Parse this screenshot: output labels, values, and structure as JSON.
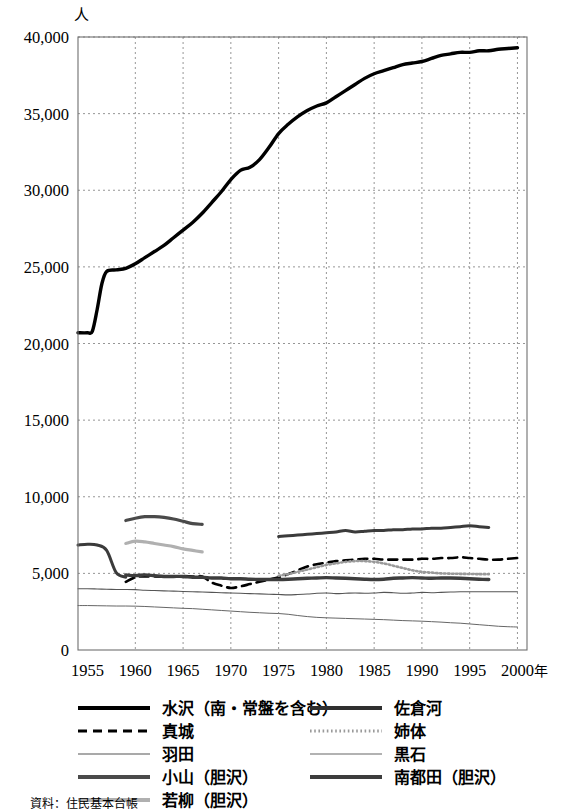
{
  "chart_data": {
    "type": "line",
    "title": "",
    "xlabel": "年",
    "ylabel": "人",
    "xlim": [
      1954,
      2001
    ],
    "ylim": [
      0,
      40000
    ],
    "grid": true,
    "legend_position": "bottom",
    "x_ticks": [
      "1955",
      "1960",
      "1965",
      "1970",
      "1975",
      "1980",
      "1985",
      "1990",
      "1995",
      "2000"
    ],
    "x_tick_values": [
      1955,
      1960,
      1965,
      1970,
      1975,
      1980,
      1985,
      1990,
      1995,
      2000
    ],
    "y_ticks": [
      "0",
      "5,000",
      "10,000",
      "15,000",
      "20,000",
      "25,000",
      "30,000",
      "35,000",
      "40,000"
    ],
    "y_tick_values": [
      0,
      5000,
      10000,
      15000,
      20000,
      25000,
      30000,
      35000,
      40000
    ],
    "series": [
      {
        "name": "水沢（南・常盤を含む）",
        "style": "thick-solid",
        "color": "#000000",
        "width": 3.4,
        "dash": "",
        "x": [
          1954,
          1955,
          1955.5,
          1956,
          1956.5,
          1957,
          1958,
          1959,
          1960,
          1961,
          1962,
          1963,
          1964,
          1965,
          1966,
          1967,
          1968,
          1969,
          1970,
          1971,
          1972,
          1973,
          1974,
          1975,
          1976,
          1977,
          1978,
          1979,
          1980,
          1981,
          1982,
          1983,
          1984,
          1985,
          1986,
          1987,
          1988,
          1989,
          1990,
          1991,
          1992,
          1993,
          1994,
          1995,
          1996,
          1997,
          1998,
          1999,
          2000
        ],
        "values": [
          20700,
          20700,
          20800,
          22200,
          23900,
          24700,
          24800,
          24900,
          25200,
          25600,
          26000,
          26400,
          26900,
          27400,
          27900,
          28500,
          29200,
          29900,
          30700,
          31300,
          31500,
          32000,
          32800,
          33700,
          34300,
          34800,
          35200,
          35500,
          35700,
          36100,
          36500,
          36900,
          37300,
          37600,
          37800,
          38000,
          38200,
          38300,
          38400,
          38600,
          38800,
          38900,
          39000,
          39000,
          39100,
          39100,
          39200,
          39250,
          39300
        ]
      },
      {
        "name": "佐倉河",
        "style": "thick-solid",
        "color": "#3b3b3b",
        "width": 3.0,
        "dash": "",
        "segments": [
          {
            "x": [
              1954,
              1955,
              1956,
              1957,
              1958,
              1959
            ],
            "values": [
              6850,
              6900,
              6850,
              6500,
              5050,
              4750
            ]
          },
          {
            "x": [
              1975,
              1976,
              1977,
              1978,
              1979,
              1980,
              1981,
              1982,
              1983,
              1984,
              1985,
              1986,
              1987,
              1988,
              1989,
              1990,
              1991,
              1992,
              1993,
              1994,
              1995,
              1996,
              1997
            ],
            "values": [
              7400,
              7450,
              7500,
              7550,
              7600,
              7650,
              7700,
              7800,
              7700,
              7750,
              7800,
              7800,
              7850,
              7850,
              7900,
              7900,
              7950,
              7950,
              8000,
              8050,
              8100,
              8050,
              8000
            ]
          }
        ]
      },
      {
        "name": "真城",
        "style": "thick-dashed",
        "color": "#000000",
        "width": 2.6,
        "dash": "9 6",
        "x": [
          1959,
          1960,
          1961,
          1962,
          1963,
          1964,
          1965,
          1966,
          1967,
          1968,
          1969,
          1970,
          1971,
          1972,
          1973,
          1974,
          1975,
          1976,
          1977,
          1978,
          1979,
          1980,
          1981,
          1982,
          1983,
          1984,
          1985,
          1986,
          1987,
          1988,
          1989,
          1990,
          1991,
          1992,
          1993,
          1994,
          1995,
          1996,
          1997,
          1998,
          1999,
          2000
        ],
        "values": [
          4450,
          4750,
          4800,
          4800,
          4780,
          4800,
          4820,
          4800,
          4790,
          4400,
          4200,
          4050,
          4150,
          4300,
          4450,
          4600,
          4750,
          4950,
          5200,
          5450,
          5600,
          5700,
          5800,
          5850,
          5900,
          5950,
          5950,
          5900,
          5900,
          5900,
          5900,
          5950,
          5950,
          6000,
          6000,
          6050,
          6000,
          5950,
          5900,
          5900,
          5950,
          6000
        ]
      },
      {
        "name": "姉体",
        "style": "dotted",
        "color": "#9a9a9a",
        "width": 2.6,
        "dash": "1.5 2.5",
        "x": [
          1975,
          1976,
          1977,
          1978,
          1979,
          1980,
          1981,
          1982,
          1983,
          1984,
          1985,
          1986,
          1987,
          1988,
          1989,
          1990,
          1991,
          1992,
          1993,
          1994,
          1995,
          1996,
          1997
        ],
        "values": [
          4850,
          4950,
          5100,
          5250,
          5400,
          5550,
          5650,
          5750,
          5800,
          5800,
          5750,
          5650,
          5500,
          5350,
          5200,
          5100,
          5050,
          5000,
          4980,
          4970,
          4960,
          4950,
          4950
        ]
      },
      {
        "name": "羽田",
        "style": "thin-solid",
        "color": "#555555",
        "width": 1.1,
        "dash": "",
        "x": [
          1954,
          1955,
          1956,
          1957,
          1958,
          1959,
          1960,
          1961,
          1962,
          1963,
          1964,
          1965,
          1966,
          1967,
          1968,
          1969,
          1970,
          1971,
          1972,
          1973,
          1974,
          1975,
          1976,
          1977,
          1978,
          1979,
          1980,
          1981,
          1982,
          1983,
          1984,
          1985,
          1986,
          1987,
          1988,
          1989,
          1990,
          1991,
          1992,
          1993,
          1994,
          1995,
          1996,
          1997,
          1998,
          1999,
          2000
        ],
        "values": [
          4000,
          4000,
          3980,
          3960,
          3950,
          3950,
          3940,
          3900,
          3880,
          3860,
          3840,
          3820,
          3800,
          3780,
          3760,
          3740,
          3720,
          3700,
          3680,
          3660,
          3640,
          3620,
          3600,
          3620,
          3650,
          3700,
          3720,
          3680,
          3700,
          3720,
          3700,
          3720,
          3760,
          3740,
          3700,
          3720,
          3760,
          3740,
          3760,
          3780,
          3800,
          3800,
          3800,
          3800,
          3800,
          3800,
          3800
        ]
      },
      {
        "name": "黒石",
        "style": "thin-solid",
        "color": "#666666",
        "width": 1.0,
        "dash": "",
        "x": [
          1954,
          1955,
          1956,
          1957,
          1958,
          1959,
          1960,
          1961,
          1962,
          1963,
          1964,
          1965,
          1966,
          1967,
          1968,
          1969,
          1970,
          1971,
          1972,
          1973,
          1974,
          1975,
          1976,
          1977,
          1978,
          1979,
          1980,
          1981,
          1982,
          1983,
          1984,
          1985,
          1986,
          1987,
          1988,
          1989,
          1990,
          1991,
          1992,
          1993,
          1994,
          1995,
          1996,
          1997,
          1998,
          1999,
          2000
        ],
        "values": [
          2900,
          2900,
          2890,
          2880,
          2870,
          2870,
          2860,
          2840,
          2810,
          2780,
          2750,
          2720,
          2700,
          2660,
          2620,
          2580,
          2540,
          2500,
          2460,
          2430,
          2400,
          2380,
          2330,
          2250,
          2180,
          2130,
          2100,
          2080,
          2060,
          2040,
          2020,
          2000,
          1980,
          1950,
          1920,
          1900,
          1880,
          1850,
          1820,
          1780,
          1750,
          1700,
          1650,
          1600,
          1550,
          1520,
          1500
        ]
      },
      {
        "name": "小山（胆沢）",
        "style": "thick-solid",
        "color": "#4a4a4a",
        "width": 3.2,
        "dash": "",
        "x": [
          1959,
          1960,
          1961,
          1962,
          1963,
          1964,
          1965,
          1966,
          1967
        ],
        "values": [
          8450,
          8600,
          8700,
          8700,
          8650,
          8550,
          8400,
          8250,
          8200
        ]
      },
      {
        "name": "南都田（胆沢）",
        "style": "thick-solid",
        "color": "#3d3d3d",
        "width": 3.4,
        "dash": "",
        "x": [
          1959,
          1960,
          1961,
          1962,
          1963,
          1964,
          1965,
          1966,
          1967,
          1968,
          1969,
          1970,
          1971,
          1972,
          1973,
          1974,
          1975,
          1976,
          1977,
          1978,
          1979,
          1980,
          1981,
          1982,
          1983,
          1984,
          1985,
          1986,
          1987,
          1988,
          1989,
          1990,
          1991,
          1992,
          1993,
          1994,
          1995,
          1996,
          1997
        ],
        "values": [
          4900,
          4850,
          4900,
          4850,
          4800,
          4800,
          4800,
          4750,
          4750,
          4700,
          4700,
          4650,
          4650,
          4620,
          4600,
          4600,
          4600,
          4620,
          4650,
          4680,
          4700,
          4720,
          4700,
          4680,
          4650,
          4620,
          4600,
          4620,
          4680,
          4700,
          4720,
          4700,
          4680,
          4700,
          4700,
          4680,
          4650,
          4620,
          4600
        ]
      },
      {
        "name": "若柳（胆沢）",
        "style": "thick-light",
        "color": "#b0b0b0",
        "width": 3.2,
        "dash": "",
        "x": [
          1959,
          1960,
          1961,
          1962,
          1963,
          1964,
          1965,
          1966,
          1967
        ],
        "values": [
          6950,
          7100,
          7050,
          6950,
          6850,
          6750,
          6600,
          6500,
          6400
        ]
      }
    ]
  },
  "legend": {
    "items": [
      {
        "label": "水沢（南・常盤を含む）",
        "style": "thick-solid",
        "color": "#000000"
      },
      {
        "label": "佐倉河",
        "style": "thick-solid",
        "color": "#2f2f2f"
      },
      {
        "label": "真城",
        "style": "thick-dashed",
        "color": "#000000"
      },
      {
        "label": "姉体",
        "style": "dotted",
        "color": "#9a9a9a"
      },
      {
        "label": "羽田",
        "style": "thin-solid",
        "color": "#555555"
      },
      {
        "label": "黒石",
        "style": "thin-solid",
        "color": "#666666"
      },
      {
        "label": "小山（胆沢）",
        "style": "thick-solid",
        "color": "#4a4a4a"
      },
      {
        "label": "南都田（胆沢）",
        "style": "thick-solid",
        "color": "#3d3d3d"
      },
      {
        "label": "若柳（胆沢）",
        "style": "thick-light",
        "color": "#b0b0b0"
      }
    ]
  },
  "caption": {
    "text": "資料：住民基本台帳"
  }
}
